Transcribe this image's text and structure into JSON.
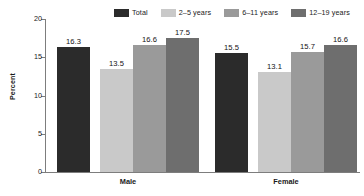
{
  "chart_data": {
    "type": "bar",
    "title": "",
    "subtitle": "",
    "xlabel": "",
    "ylabel": "Percent",
    "ylim": [
      0,
      20
    ],
    "yticks": [
      0,
      5,
      10,
      15,
      20
    ],
    "ytick_labels": [
      "0",
      "5",
      "10",
      "15",
      "20"
    ],
    "grid": false,
    "legend_position": "top",
    "categories": [
      "Male",
      "Female"
    ],
    "series": [
      {
        "name": "Total",
        "color": "#2b2b2b",
        "values": [
          16.3,
          15.5
        ],
        "value_labels": [
          "16.3",
          "15.5"
        ]
      },
      {
        "name": "2–5 years",
        "color": "#c9c9c9",
        "values": [
          13.5,
          13.1
        ],
        "value_labels": [
          "13.5",
          "13.1"
        ]
      },
      {
        "name": "6–11 years",
        "color": "#9a9a9a",
        "values": [
          16.6,
          15.7
        ],
        "value_labels": [
          "16.6",
          "15.7"
        ]
      },
      {
        "name": "12–19 years",
        "color": "#6e6e6e",
        "values": [
          17.5,
          16.6
        ],
        "value_labels": [
          "17.5",
          "16.6"
        ]
      }
    ]
  },
  "legend": {
    "items": [
      {
        "label": "Total",
        "color": "#2b2b2b"
      },
      {
        "label": "2–5 years",
        "color": "#c9c9c9"
      },
      {
        "label": "6–11 years",
        "color": "#9a9a9a"
      },
      {
        "label": "12–19 years",
        "color": "#6e6e6e"
      }
    ]
  },
  "axes": {
    "y_title": "Percent",
    "y_tick_labels": [
      "20",
      "15",
      "10",
      "5",
      "0"
    ],
    "x_tick_labels": [
      "Male",
      "Female"
    ]
  },
  "colors": {
    "axis": "#7d7d7d",
    "text": "#1a1a1a",
    "background": "#ffffff"
  }
}
